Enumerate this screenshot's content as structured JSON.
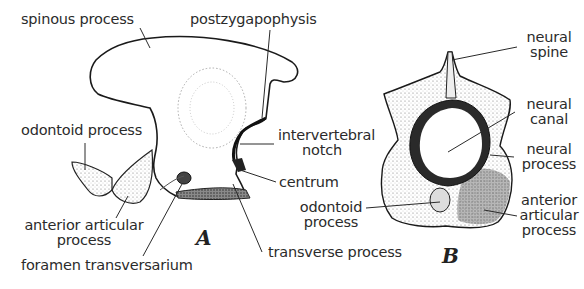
{
  "figure": {
    "panels": [
      {
        "id": "A",
        "label": "A",
        "view": "lateral",
        "annotations": [
          {
            "key": "spinous_process",
            "text": "spinous process"
          },
          {
            "key": "postzygapophysis",
            "text": "postzygapophysis"
          },
          {
            "key": "odontoid_process",
            "text": "odontoid process"
          },
          {
            "key": "intervertebral_notch",
            "lines": [
              "intervertebral",
              "notch"
            ]
          },
          {
            "key": "centrum",
            "text": "centrum"
          },
          {
            "key": "anterior_articular_process",
            "lines": [
              "anterior articular",
              "process"
            ]
          },
          {
            "key": "foramen_transversarium",
            "text": "foramen transversarium"
          },
          {
            "key": "transverse_process",
            "text": "transverse process"
          }
        ]
      },
      {
        "id": "B",
        "label": "B",
        "view": "anterior",
        "annotations": [
          {
            "key": "neural_spine",
            "lines": [
              "neural",
              "spine"
            ]
          },
          {
            "key": "neural_canal",
            "lines": [
              "neural",
              "canal"
            ]
          },
          {
            "key": "neural_process",
            "lines": [
              "neural",
              "process"
            ]
          },
          {
            "key": "odontoid_process",
            "lines": [
              "odontoid",
              "process"
            ]
          },
          {
            "key": "anterior_articular_process",
            "lines": [
              "anterior",
              "articular",
              "process"
            ]
          }
        ]
      }
    ]
  }
}
